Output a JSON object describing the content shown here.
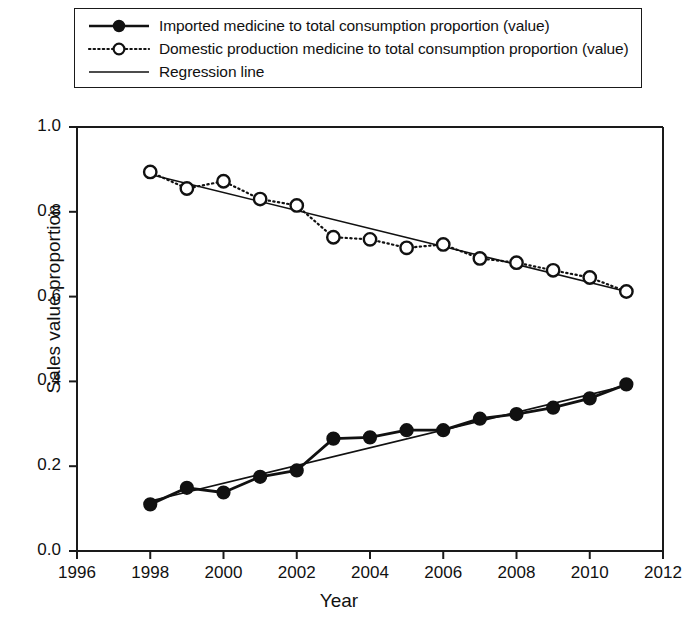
{
  "chart_data": {
    "type": "line",
    "title": "",
    "xlabel": "Year",
    "ylabel": "Sales value proportion",
    "xlim": [
      1996,
      2012
    ],
    "ylim": [
      0.0,
      1.0
    ],
    "xticks": [
      1996,
      1998,
      2000,
      2002,
      2004,
      2006,
      2008,
      2010,
      2012
    ],
    "yticks": [
      0.0,
      0.2,
      0.4,
      0.6,
      0.8,
      1.0
    ],
    "xtick_labels": [
      "1996",
      "1998",
      "2000",
      "2002",
      "2004",
      "2006",
      "2008",
      "2010",
      "2012"
    ],
    "ytick_labels": [
      "0.0",
      "0.2",
      "0.4",
      "0.6",
      "0.8",
      "1.0"
    ],
    "grid": false,
    "legend_position": "top",
    "x": [
      1998,
      1999,
      2000,
      2001,
      2002,
      2003,
      2004,
      2005,
      2006,
      2007,
      2008,
      2009,
      2010,
      2011
    ],
    "series": [
      {
        "name": "Imported medicine to total consumption proportion (value)",
        "marker": "filled-circle",
        "linestyle": "solid",
        "color": "#111111",
        "values": [
          0.11,
          0.149,
          0.138,
          0.175,
          0.19,
          0.265,
          0.268,
          0.285,
          0.285,
          0.312,
          0.323,
          0.338,
          0.36,
          0.393
        ]
      },
      {
        "name": "Domestic production medicine to total consumption proportion (value)",
        "marker": "open-circle",
        "linestyle": "dotted",
        "color": "#111111",
        "values": [
          0.894,
          0.855,
          0.872,
          0.83,
          0.815,
          0.74,
          0.735,
          0.715,
          0.723,
          0.69,
          0.68,
          0.662,
          0.645,
          0.612
        ]
      }
    ],
    "regression_lines": [
      {
        "name": "Regression line",
        "for_series": "Imported medicine to total consumption proportion (value)",
        "x": [
          1998,
          2011
        ],
        "y": [
          0.118,
          0.39
        ]
      },
      {
        "name": "Regression line",
        "for_series": "Domestic production medicine to total consumption proportion (value)",
        "x": [
          1998,
          2011
        ],
        "y": [
          0.888,
          0.612
        ]
      }
    ],
    "legend": [
      {
        "label": "Imported medicine to total consumption proportion (value)",
        "key": "filled-circle-solid-line"
      },
      {
        "label": "Domestic production medicine to total consumption proportion (value)",
        "key": "open-circle-dotted-line"
      },
      {
        "label": "Regression line",
        "key": "plain-solid-line"
      }
    ]
  }
}
